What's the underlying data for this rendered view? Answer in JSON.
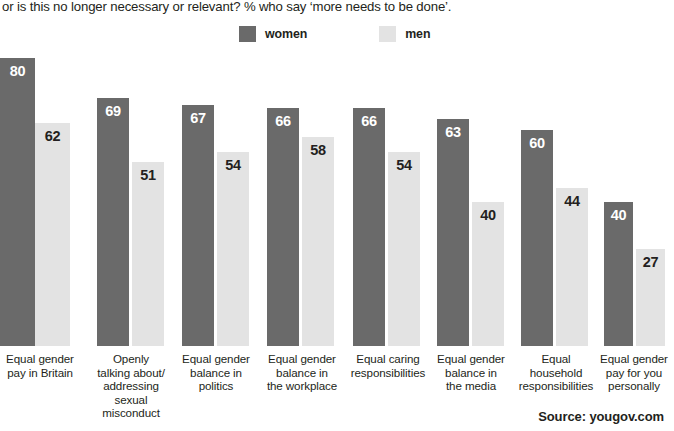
{
  "question": {
    "text": "or is this no longer necessary or relevant? % who say ‘more needs to be done’."
  },
  "legend": {
    "position": "top-center",
    "items": [
      {
        "label": "women",
        "color": "#6a6a6a",
        "swatch_name": "legend-swatch-women"
      },
      {
        "label": "men",
        "color": "#e3e3e3",
        "swatch_name": "legend-swatch-men"
      }
    ]
  },
  "source": {
    "text": "Source: yougov.com"
  },
  "colors": {
    "women": "#6a6a6a",
    "men": "#e3e3e3",
    "text": "#231f20",
    "background": "#ffffff"
  },
  "chart_data": {
    "type": "bar",
    "title": "",
    "subtitle": "or is this no longer necessary or relevant? % who say ‘more needs to be done’.",
    "xlabel": "",
    "ylabel": "",
    "ylim": [
      0,
      100
    ],
    "grid": false,
    "legend_position": "top-center",
    "categories": [
      "Equal gender pay in Britain",
      "Openly talking about/ addressing sexual misconduct",
      "Equal gender balance in politics",
      "Equal gender balance in the workplace",
      "Equal caring responsibilities",
      "Equal gender balance in the media",
      "Equal household responsibilities",
      "Equal gender pay for you personally"
    ],
    "category_lines": [
      [
        "Equal gender",
        "pay in Britain"
      ],
      [
        "Openly",
        "talking about/",
        "addressing",
        "sexual",
        "misconduct"
      ],
      [
        "Equal gender",
        "balance in",
        "politics"
      ],
      [
        "Equal gender",
        "balance in",
        "the workplace"
      ],
      [
        "Equal caring",
        "responsibilities"
      ],
      [
        "Equal gender",
        "balance in",
        "the media"
      ],
      [
        "Equal",
        "household",
        "responsibilities"
      ],
      [
        "Equal gender",
        "pay for you",
        "personally"
      ]
    ],
    "series": [
      {
        "name": "women",
        "color": "#6a6a6a",
        "values": [
          80,
          69,
          67,
          66,
          66,
          63,
          60,
          40
        ]
      },
      {
        "name": "men",
        "color": "#e3e3e3",
        "values": [
          62,
          51,
          54,
          58,
          54,
          40,
          44,
          27
        ]
      }
    ]
  },
  "layout": {
    "plot_height_px": 302,
    "value_scale_px_per_unit": 3.6,
    "groups": [
      {
        "left": 0,
        "bar_w": 35,
        "gap": 0
      },
      {
        "left": 97,
        "bar_w": 32,
        "gap": 3
      },
      {
        "left": 182,
        "bar_w": 32,
        "gap": 3
      },
      {
        "left": 267,
        "bar_w": 32,
        "gap": 3
      },
      {
        "left": 353,
        "bar_w": 32,
        "gap": 3
      },
      {
        "left": 437,
        "bar_w": 32,
        "gap": 3
      },
      {
        "left": 521,
        "bar_w": 32,
        "gap": 3
      },
      {
        "left": 604,
        "bar_w": 29,
        "gap": 3
      }
    ],
    "label_blocks": [
      {
        "left": 0,
        "width": 80
      },
      {
        "left": 88,
        "width": 86
      },
      {
        "left": 173,
        "width": 86
      },
      {
        "left": 256,
        "width": 92
      },
      {
        "left": 338,
        "width": 100
      },
      {
        "left": 428,
        "width": 86
      },
      {
        "left": 506,
        "width": 100
      },
      {
        "left": 594,
        "width": 80
      }
    ]
  }
}
